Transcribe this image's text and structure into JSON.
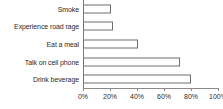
{
  "chart_data": {
    "type": "bar",
    "orientation": "horizontal",
    "title": "",
    "subtitle": "",
    "xlabel": "",
    "ylabel": "",
    "categories": [
      "Smoke",
      "Experience road rage",
      "Eat a meal",
      "Talk on cell phone",
      "Drink beverage"
    ],
    "values": [
      21,
      22,
      41,
      72,
      80
    ],
    "value_suffix": "%",
    "xlim": [
      0,
      100
    ],
    "xticks": [
      0,
      20,
      40,
      60,
      80,
      100
    ],
    "xtick_labels": [
      "0%",
      "20%",
      "40%",
      "60%",
      "80%",
      "100%"
    ],
    "grid": false,
    "legend": null,
    "series": [
      {
        "name": "Percent of drivers",
        "values": [
          21,
          22,
          41,
          72,
          80
        ]
      }
    ],
    "colors": {
      "bar_fill": "#ffffff",
      "bar_stroke": "#6f6f6f",
      "axis": "#8a8a8a",
      "text": "#2b2b2b",
      "background": "#ffffff"
    }
  },
  "rows": [
    {
      "label": "Smoke",
      "value": 21,
      "clipped": true
    },
    {
      "label": "Experience road rage",
      "value": 22,
      "clipped": false
    },
    {
      "label": "Eat a meal",
      "value": 41,
      "clipped": false
    },
    {
      "label": "Talk on cell phone",
      "value": 72,
      "clipped": false
    },
    {
      "label": "Drink beverage",
      "value": 80,
      "clipped": false
    }
  ],
  "axis": {
    "ticks": [
      {
        "label": "0%",
        "value": 0
      },
      {
        "label": "20%",
        "value": 20
      },
      {
        "label": "40%",
        "value": 40
      },
      {
        "label": "60%",
        "value": 60
      },
      {
        "label": "80%",
        "value": 80
      },
      {
        "label": "100%",
        "value": 100
      }
    ]
  }
}
